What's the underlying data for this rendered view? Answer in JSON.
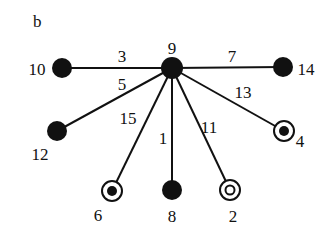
{
  "panel_label": "b",
  "colors": {
    "ink": "#111111",
    "background": "#ffffff"
  },
  "center": {
    "id": "9",
    "x": 172,
    "y": 68,
    "r": 11,
    "style": "filled",
    "label": "9",
    "lx": 172,
    "ly": 54
  },
  "nodes": [
    {
      "id": "10",
      "x": 62,
      "y": 68,
      "style": "filled",
      "label": "10",
      "lx": 37,
      "ly": 75
    },
    {
      "id": "14",
      "x": 283,
      "y": 67,
      "style": "filled",
      "label": "14",
      "lx": 306,
      "ly": 75
    },
    {
      "id": "12",
      "x": 57,
      "y": 131,
      "style": "filled",
      "label": "12",
      "lx": 40,
      "ly": 160
    },
    {
      "id": "6",
      "x": 112,
      "y": 191,
      "style": "ring-dot",
      "label": "6",
      "lx": 98,
      "ly": 221
    },
    {
      "id": "8",
      "x": 172,
      "y": 190,
      "style": "filled",
      "label": "8",
      "lx": 172,
      "ly": 222
    },
    {
      "id": "2",
      "x": 230,
      "y": 190,
      "style": "ring-ring",
      "label": "2",
      "lx": 233,
      "ly": 222
    },
    {
      "id": "4",
      "x": 284,
      "y": 131,
      "style": "ring-dot",
      "label": "4",
      "lx": 300,
      "ly": 147
    }
  ],
  "edges": [
    {
      "from": "9",
      "to": "10",
      "label": "3",
      "lx": 122,
      "ly": 62
    },
    {
      "from": "9",
      "to": "14",
      "label": "7",
      "lx": 232,
      "ly": 62
    },
    {
      "from": "9",
      "to": "12",
      "label": "5",
      "lx": 122,
      "ly": 90
    },
    {
      "from": "9",
      "to": "4",
      "label": "13",
      "lx": 243,
      "ly": 98
    },
    {
      "from": "9",
      "to": "6",
      "label": "15",
      "lx": 128,
      "ly": 124
    },
    {
      "from": "9",
      "to": "8",
      "label": "1",
      "lx": 163,
      "ly": 144
    },
    {
      "from": "9",
      "to": "2",
      "label": "11",
      "lx": 209,
      "ly": 133
    }
  ]
}
